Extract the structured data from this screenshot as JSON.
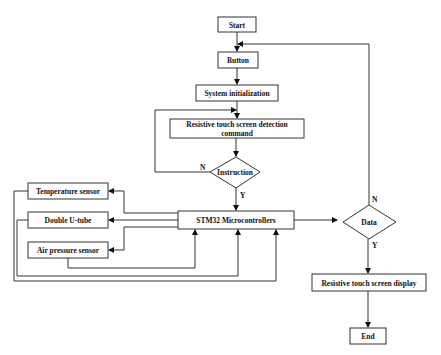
{
  "diagram": {
    "type": "flowchart",
    "nodes": {
      "start": {
        "label": "Start",
        "shape": "rect"
      },
      "button": {
        "label": "Button",
        "shape": "rect"
      },
      "init": {
        "label": "System initialization",
        "shape": "rect"
      },
      "detect_line1": {
        "label": "Resistive touch screen detection",
        "shape": "rect"
      },
      "detect_line2": {
        "label": "command"
      },
      "instruction": {
        "label": "Instruction",
        "shape": "diamond"
      },
      "mcu": {
        "label": "STM32 Microcontrollers",
        "shape": "rect"
      },
      "temp": {
        "label": "Temperature sensor",
        "shape": "rect"
      },
      "utube": {
        "label": "Double U-tube",
        "shape": "rect"
      },
      "air": {
        "label": "Air pressure sensor",
        "shape": "rect"
      },
      "data": {
        "label": "Data",
        "shape": "diamond"
      },
      "display": {
        "label": "Resistive touch screen display",
        "shape": "rect"
      },
      "end": {
        "label": "End",
        "shape": "rect"
      }
    },
    "edge_labels": {
      "instruction_no": "N",
      "instruction_yes": "Y",
      "data_no": "N",
      "data_yes": "Y"
    },
    "edges": [
      {
        "from": "Start",
        "to": "Button"
      },
      {
        "from": "Button",
        "to": "System initialization"
      },
      {
        "from": "System initialization",
        "to": "Resistive touch screen detection command"
      },
      {
        "from": "Resistive touch screen detection command",
        "to": "Instruction"
      },
      {
        "from": "Instruction",
        "to": "Resistive touch screen detection command",
        "label": "N"
      },
      {
        "from": "Instruction",
        "to": "STM32 Microcontrollers",
        "label": "Y"
      },
      {
        "from": "STM32 Microcontrollers",
        "to": "Temperature sensor"
      },
      {
        "from": "STM32 Microcontrollers",
        "to": "Double U-tube"
      },
      {
        "from": "STM32 Microcontrollers",
        "to": "Air pressure sensor"
      },
      {
        "from": "Temperature sensor",
        "to": "STM32 Microcontrollers"
      },
      {
        "from": "Double U-tube",
        "to": "STM32 Microcontrollers"
      },
      {
        "from": "Air pressure sensor",
        "to": "STM32 Microcontrollers"
      },
      {
        "from": "STM32 Microcontrollers",
        "to": "Data"
      },
      {
        "from": "Data",
        "to": "Button",
        "label": "N"
      },
      {
        "from": "Data",
        "to": "Resistive touch screen display",
        "label": "Y"
      },
      {
        "from": "Resistive touch screen display",
        "to": "End"
      }
    ]
  }
}
